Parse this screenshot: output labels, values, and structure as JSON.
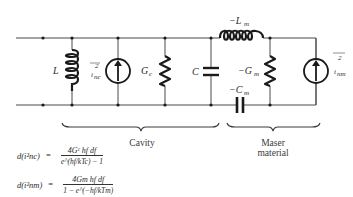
{
  "diagram": {
    "type": "equivalent-circuit",
    "components": {
      "inductor_cavity": {
        "label": "L"
      },
      "noise_source_cavity": {
        "label": "ī² nc",
        "symbol": "i",
        "sup": "2",
        "sub": "nc"
      },
      "conductance_cavity": {
        "label": "G",
        "sub": "c"
      },
      "capacitor_cavity": {
        "label": "C"
      },
      "inductor_maser": {
        "label": "−L",
        "sub": "m"
      },
      "conductance_maser": {
        "label": "−G",
        "sub": "m"
      },
      "capacitor_maser": {
        "label": "−C",
        "sub": "m"
      },
      "noise_source_maser": {
        "label": "ī² nm",
        "symbol": "i",
        "sup": "2",
        "sub": "nm"
      }
    },
    "braces": {
      "cavity": "Cavity",
      "maser_line1": "Maser",
      "maser_line2": "material"
    },
    "colors": {
      "line": "#4a4a4a",
      "component": "#1a1a1a",
      "background": "#ffffff"
    }
  },
  "formulas": {
    "f1": {
      "lhs": "d(i²nc)",
      "numerator": "4Gᶜ hf df",
      "denominator": "e^(hf/kTc) − 1"
    },
    "f2": {
      "lhs": "d(i²nm)",
      "numerator": "4Gm hf df",
      "denominator": "1 − e^(−hf/kTm)"
    }
  }
}
